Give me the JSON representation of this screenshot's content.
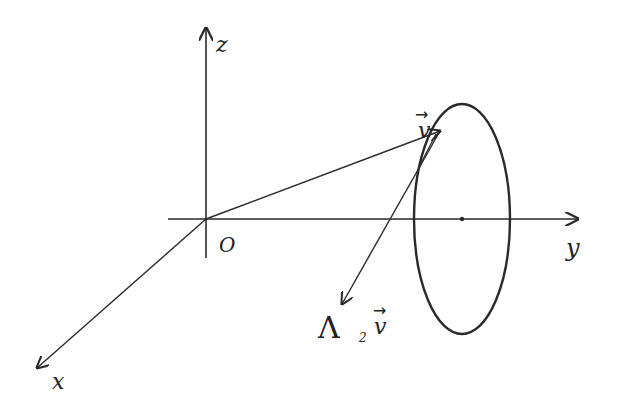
{
  "diagram": {
    "type": "3d-coordinate-sketch",
    "stroke_color": "#2a2a2a",
    "axes": {
      "z": {
        "label": "z"
      },
      "y": {
        "label": "y"
      },
      "x": {
        "label": "x"
      },
      "origin": {
        "label": "O"
      }
    },
    "vectors": {
      "v": {
        "label": "v",
        "arrow": "→"
      },
      "lambda_v": {
        "label_main": "Λ",
        "label_sub": "2",
        "label_vec": "v",
        "arrow": "→"
      }
    },
    "shape": {
      "name": "ellipse-section"
    }
  }
}
